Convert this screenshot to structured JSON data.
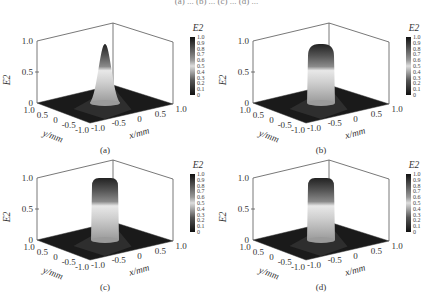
{
  "figure": {
    "top_text": "(a) ... (b) ... (c) ... (d) ..."
  },
  "chart_data": [
    {
      "type": "surface3d",
      "panel": "(a)",
      "zlabel": "E2",
      "xlabel": "x/mm",
      "ylabel": "y/mm",
      "x_ticks": [
        "-1.0",
        "-0.5",
        "0",
        "0.5",
        "1.0"
      ],
      "y_ticks": [
        "1.0",
        "0.5",
        "0",
        "-0.5",
        "-1.0"
      ],
      "z_ticks": [
        "0",
        "0.5",
        "1.0"
      ],
      "zlim": [
        0,
        1.0
      ],
      "colorbar": {
        "label": "E2",
        "ticks": [
          "1.0",
          "0.9",
          "0.8",
          "0.7",
          "0.6",
          "0.5",
          "0.4",
          "0.3",
          "0.2",
          "0.1",
          "0"
        ]
      },
      "profile": "gaussian",
      "peak": 0.95,
      "top_width_px": 6,
      "base_width_px": 30
    },
    {
      "type": "surface3d",
      "panel": "(b)",
      "zlabel": "E2",
      "xlabel": "x/mm",
      "ylabel": "y/mm",
      "x_ticks": [
        "-1.0",
        "-0.5",
        "0",
        "0.5",
        "1.0"
      ],
      "y_ticks": [
        "1.0",
        "0.5",
        "0",
        "-0.5",
        "-1.0"
      ],
      "z_ticks": [
        "0",
        "0.5",
        "1.0"
      ],
      "zlim": [
        0,
        1.0
      ],
      "colorbar": {
        "label": "E2",
        "ticks": [
          "1.0",
          "0.9",
          "0.8",
          "0.7",
          "0.6",
          "0.5",
          "0.4",
          "0.3",
          "0.2",
          "0.1",
          "0"
        ]
      },
      "profile": "super-gaussian",
      "peak": 0.95,
      "top_width_px": 14,
      "base_width_px": 28
    },
    {
      "type": "surface3d",
      "panel": "(c)",
      "zlabel": "E2",
      "xlabel": "x/mm",
      "ylabel": "y/mm",
      "x_ticks": [
        "-1.0",
        "-0.5",
        "0",
        "0.5",
        "1.0"
      ],
      "y_ticks": [
        "1.0",
        "0.5",
        "0",
        "-0.5",
        "-1.0"
      ],
      "z_ticks": [
        "0",
        "0.5",
        "1.0"
      ],
      "zlim": [
        0,
        1.0
      ],
      "colorbar": {
        "label": "E2",
        "ticks": [
          "1.0",
          "0.9",
          "0.8",
          "0.7",
          "0.6",
          "0.5",
          "0.4",
          "0.3",
          "0.2",
          "0.1",
          "0"
        ]
      },
      "profile": "flat-top",
      "peak": 1.0,
      "top_width_px": 18,
      "base_width_px": 28
    },
    {
      "type": "surface3d",
      "panel": "(d)",
      "zlabel": "E2",
      "xlabel": "x/mm",
      "ylabel": "y/mm",
      "x_ticks": [
        "-1.0",
        "-0.5",
        "0",
        "0.5",
        "1.0"
      ],
      "y_ticks": [
        "1.0",
        "0.5",
        "0",
        "-0.5",
        "-1.0"
      ],
      "z_ticks": [
        "0",
        "0.5",
        "1.0"
      ],
      "zlim": [
        0,
        1.0
      ],
      "colorbar": {
        "label": "E2",
        "ticks": [
          "1.0",
          "0.9",
          "0.8",
          "0.7",
          "0.6",
          "0.5",
          "0.4",
          "0.3",
          "0.2",
          "0.1",
          "0"
        ]
      },
      "profile": "flat-top",
      "peak": 1.0,
      "top_width_px": 22,
      "base_width_px": 28
    }
  ]
}
